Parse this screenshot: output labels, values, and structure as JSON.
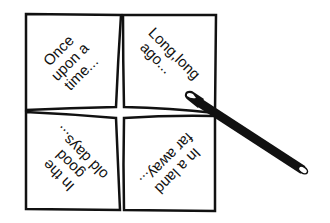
{
  "diagram": {
    "colors": {
      "ink": "#111111",
      "paper": "#ffffff"
    },
    "quadrants": [
      {
        "position": "top-left",
        "lines": [
          "Once",
          "upon a",
          "time..."
        ]
      },
      {
        "position": "top-right",
        "lines": [
          "Long,long",
          "ago..."
        ]
      },
      {
        "position": "bottom-left",
        "lines": [
          "In the",
          "good",
          "old days..."
        ]
      },
      {
        "position": "bottom-right",
        "lines": [
          "In a land",
          "far away..."
        ]
      }
    ],
    "pen": {
      "icon": "pen-icon"
    }
  }
}
